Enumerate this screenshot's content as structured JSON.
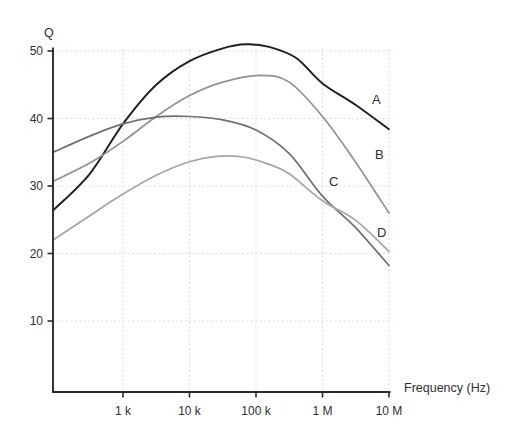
{
  "chart_data": {
    "type": "line",
    "title": "",
    "ylabel": "Q",
    "xlabel": "Frequency (Hz)",
    "x_scale": "log10",
    "x_range_hz": [
      100,
      10000000
    ],
    "y_range": [
      0,
      52
    ],
    "grid": "dashed-light",
    "legend_position": "inline-labels-right",
    "x_ticks": [
      {
        "hz": 1000,
        "label": "1 k"
      },
      {
        "hz": 10000,
        "label": "10 k"
      },
      {
        "hz": 100000,
        "label": "100 k"
      },
      {
        "hz": 1000000,
        "label": "1 M"
      },
      {
        "hz": 10000000,
        "label": "10 M"
      }
    ],
    "y_ticks": [
      50,
      40,
      30,
      20,
      10
    ],
    "series": [
      {
        "name": "A",
        "color": "#1e1e1e",
        "label_color": "#565656",
        "width": 1.9,
        "peak": {
          "q": 51,
          "hz": 70000
        },
        "points_log10hz_q": [
          [
            1.95,
            26.4
          ],
          [
            2.5,
            31.8
          ],
          [
            3.0,
            39.2
          ],
          [
            3.5,
            45.0
          ],
          [
            4.0,
            48.5
          ],
          [
            4.5,
            50.4
          ],
          [
            4.85,
            51.0
          ],
          [
            5.2,
            50.6
          ],
          [
            5.6,
            49.0
          ],
          [
            6.0,
            45.2
          ],
          [
            6.5,
            42.0
          ],
          [
            7.0,
            38.4
          ]
        ]
      },
      {
        "name": "B",
        "color": "#919191",
        "label_color": "#979797",
        "width": 1.7,
        "peak": {
          "q": 46.4,
          "hz": 110000
        },
        "points_log10hz_q": [
          [
            1.95,
            30.7
          ],
          [
            2.5,
            33.4
          ],
          [
            3.0,
            36.6
          ],
          [
            3.5,
            40.3
          ],
          [
            4.0,
            43.4
          ],
          [
            4.5,
            45.4
          ],
          [
            5.05,
            46.4
          ],
          [
            5.5,
            45.4
          ],
          [
            6.0,
            40.3
          ],
          [
            6.5,
            33.5
          ],
          [
            7.0,
            26.0
          ]
        ]
      },
      {
        "name": "C",
        "color": "#6f6f6f",
        "label_color": "#7d7d7d",
        "width": 1.7,
        "peak": {
          "q": 40.3,
          "hz": 10000
        },
        "points_log10hz_q": [
          [
            1.95,
            35.0
          ],
          [
            2.5,
            37.4
          ],
          [
            3.0,
            39.2
          ],
          [
            3.5,
            40.2
          ],
          [
            4.0,
            40.3
          ],
          [
            4.5,
            39.8
          ],
          [
            5.0,
            38.3
          ],
          [
            5.5,
            34.8
          ],
          [
            6.0,
            28.5
          ],
          [
            6.5,
            23.8
          ],
          [
            7.0,
            18.2
          ]
        ]
      },
      {
        "name": "D",
        "color": "#a5a5a5",
        "label_color": "#9a9a9a",
        "width": 1.7,
        "peak": {
          "q": 34.4,
          "hz": 25000
        },
        "points_log10hz_q": [
          [
            1.95,
            22.0
          ],
          [
            2.5,
            25.6
          ],
          [
            3.0,
            28.8
          ],
          [
            3.5,
            31.6
          ],
          [
            4.0,
            33.6
          ],
          [
            4.4,
            34.4
          ],
          [
            4.8,
            34.3
          ],
          [
            5.2,
            33.2
          ],
          [
            5.5,
            31.8
          ],
          [
            6.0,
            27.8
          ],
          [
            6.5,
            24.9
          ],
          [
            7.0,
            20.3
          ]
        ]
      }
    ]
  },
  "colors": {
    "background": "#ffffff",
    "axis": "#2b2b2b",
    "grid": "#d9d9d9",
    "tick_text": "#2f2f2f"
  }
}
